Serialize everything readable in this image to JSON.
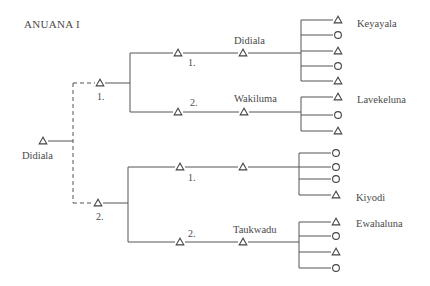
{
  "title": "ANUANA I",
  "colors": {
    "line": "#555555",
    "text": "#4a4a4a",
    "background": "#ffffff"
  },
  "root": {
    "label": "Didiala",
    "symbol": "triangle",
    "x": 43,
    "y": 141,
    "label_x": 22,
    "label_y": 159
  },
  "dashed_link": {
    "x": 73,
    "y_top": 83,
    "y_bottom": 203,
    "x_end_top": 95,
    "x_end_bottom": 93
  },
  "generation_1": [
    {
      "order_label": "1.",
      "symbol": "triangle",
      "x": 100,
      "y": 83,
      "label_x": 97,
      "label_y": 100,
      "branch_x": 130,
      "branch_top": 53,
      "branch_bottom": 112,
      "children": [
        {
          "order_label": "1.",
          "order_x": 188,
          "order_y": 66,
          "y": 53,
          "t1_x": 178,
          "name": "Didiala",
          "name_x": 234,
          "name_y": 44,
          "t2_x": 243,
          "sibling_x": 301,
          "symbol_x": 338,
          "offspring": [
            {
              "symbol": "triangle",
              "y": 20
            },
            {
              "symbol": "circle",
              "y": 35
            },
            {
              "symbol": "triangle",
              "y": 51
            },
            {
              "symbol": "circle",
              "y": 66
            },
            {
              "symbol": "triangle",
              "y": 81
            }
          ],
          "group_label": "Keyayala",
          "group_label_x": 357,
          "group_label_y": 27
        },
        {
          "order_label": "2.",
          "order_x": 190,
          "order_y": 106,
          "y": 112,
          "t1_x": 178,
          "name": "Wakiluma",
          "name_x": 234,
          "name_y": 102,
          "t2_x": 244,
          "sibling_x": 301,
          "symbol_x": 338,
          "offspring": [
            {
              "symbol": "triangle",
              "y": 97
            },
            {
              "symbol": "circle",
              "y": 115
            },
            {
              "symbol": "triangle",
              "y": 131
            }
          ],
          "group_label": "Lavekeluna",
          "group_label_x": 357,
          "group_label_y": 103
        }
      ]
    },
    {
      "order_label": "2.",
      "symbol": "triangle",
      "x": 98,
      "y": 203,
      "label_x": 96,
      "label_y": 220,
      "branch_x": 128,
      "branch_top": 167,
      "branch_bottom": 242,
      "children": [
        {
          "order_label": "1.",
          "order_x": 188,
          "order_y": 181,
          "y": 167,
          "t1_x": 180,
          "name": "",
          "name_x": 234,
          "name_y": 157,
          "t2_x": 243,
          "sibling_x": 299,
          "symbol_x": 336,
          "offspring": [
            {
              "symbol": "circle",
              "y": 153
            },
            {
              "symbol": "circle",
              "y": 167
            },
            {
              "symbol": "circle",
              "y": 179
            },
            {
              "symbol": "triangle",
              "y": 195
            }
          ],
          "group_label": "Kiyodi",
          "group_label_x": 356,
          "group_label_y": 201
        },
        {
          "order_label": "2.",
          "order_x": 188,
          "order_y": 237,
          "y": 242,
          "t1_x": 180,
          "name": "Taukwadu",
          "name_x": 233,
          "name_y": 233,
          "t2_x": 243,
          "sibling_x": 299,
          "symbol_x": 336,
          "offspring": [
            {
              "symbol": "triangle",
              "y": 222
            },
            {
              "symbol": "circle",
              "y": 236
            },
            {
              "symbol": "triangle",
              "y": 252
            },
            {
              "symbol": "circle",
              "y": 268
            }
          ],
          "group_label": "Ewahaluna",
          "group_label_x": 356,
          "group_label_y": 227
        }
      ]
    }
  ],
  "legend": {
    "triangle": "male",
    "circle": "female"
  }
}
